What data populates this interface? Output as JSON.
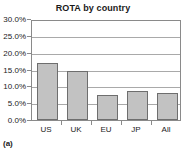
{
  "figure": {
    "caption": "(a)"
  },
  "chart_data": {
    "type": "bar",
    "title": "ROTA by country",
    "xlabel": "",
    "ylabel": "",
    "categories": [
      "US",
      "UK",
      "EU",
      "JP",
      "All"
    ],
    "values": [
      17.0,
      14.5,
      7.5,
      8.5,
      8.0
    ],
    "value_unit": "%",
    "ylim": [
      0,
      30
    ],
    "ytick_values": [
      0,
      5,
      10,
      15,
      20,
      25,
      30
    ],
    "ytick_labels": [
      "0.0%",
      "5.0%",
      "10.0%",
      "15.0%",
      "20.0%",
      "25.0%",
      "30.0%"
    ],
    "grid": true,
    "grid_axis": "y",
    "legend": false,
    "legend_position": "none",
    "bar_fill_color": "#c2c2c2",
    "bar_border_color": "#6e6e6e",
    "gridline_color": "#a9a9a9",
    "plot_border_color": "#8a8a8a",
    "background_color": "#ffffff",
    "text_color": "#1a1a1a"
  }
}
